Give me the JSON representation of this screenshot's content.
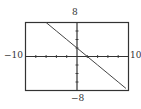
{
  "chart_data": {
    "type": "line",
    "title": "",
    "xlabel": "",
    "ylabel": "",
    "xlim": [
      -10,
      10
    ],
    "ylim": [
      -8,
      8
    ],
    "x_tick_step": 2,
    "y_tick_step": 2,
    "grid": false,
    "legend": null,
    "tick_labels": {
      "xmin": "−10",
      "xmax": "10",
      "ymin": "−8",
      "ymax": "8"
    },
    "series": [
      {
        "name": "line",
        "equation_estimate": "y = -x + 2",
        "x": [
          -6,
          -4,
          -2,
          0,
          2,
          4,
          6,
          8,
          9.5
        ],
        "y": [
          8,
          6,
          4,
          2,
          0,
          -2,
          -4,
          -6,
          -7.5
        ]
      }
    ],
    "colors": {
      "frame": "#333333",
      "axes": "#333333",
      "line": "#444444"
    }
  }
}
